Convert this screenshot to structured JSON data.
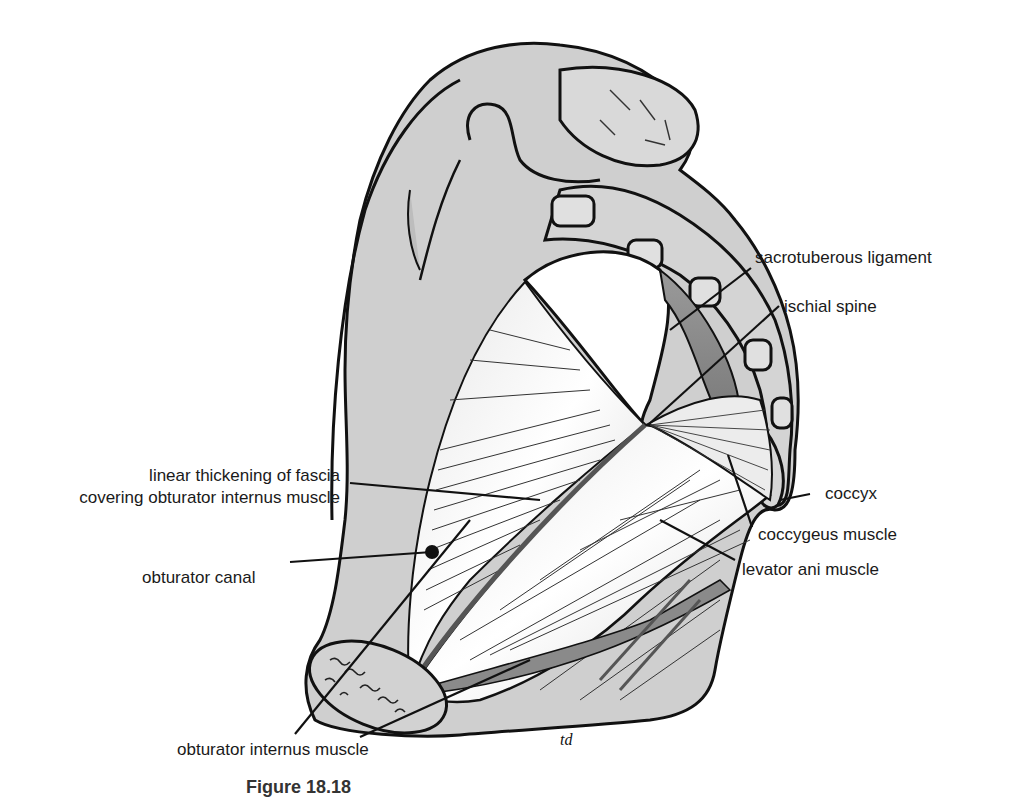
{
  "figure": {
    "colors": {
      "bone": "#cfcfcf",
      "bone_outline": "#111111",
      "muscle_light": "#f2f2f2",
      "muscle_dark": "#8f8f8f",
      "background": "#ffffff"
    },
    "artist_initials": "td",
    "caption": {
      "number": "Figure 18.18",
      "text": "Left ... (caption clipped at bottom edge)"
    }
  },
  "labels": {
    "sacrotuberous_ligament": "sacrotuberous ligament",
    "ischial_spine": "ischial spine",
    "coccyx": "coccyx",
    "coccygeus_muscle": "coccygeus muscle",
    "levator_ani_muscle": "levator ani muscle",
    "linear_thickening_line1": "linear thickening of fascia",
    "linear_thickening_line2": "covering obturator internus muscle",
    "obturator_canal": "obturator canal",
    "obturator_internus_muscle": "obturator internus muscle"
  }
}
